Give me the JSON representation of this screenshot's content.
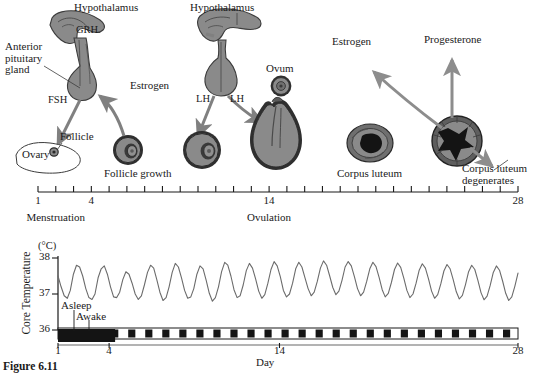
{
  "figure": {
    "caption": "Figure 6.11",
    "background": "#ffffff",
    "anatomy_fill": "#8a8a8a",
    "anatomy_stroke": "#3c3c3c",
    "arrow_color": "#808080",
    "dark_core": "#141414",
    "line_color": "#555555"
  },
  "top_panel": {
    "labels": {
      "hypothalamus_left": "Hypothalamus",
      "hypothalamus_right": "Hypothalamus",
      "grh": "GRH",
      "anterior_pituitary": "Anterior\npituitary\ngland",
      "fsh": "FSH",
      "follicle": "Follicle",
      "ovary": "Ovary",
      "estrogen_left": "Estrogen",
      "follicle_growth": "Follicle growth",
      "lh_left": "LH",
      "lh_right": "LH",
      "ovum": "Ovum",
      "estrogen_right": "Estrogen",
      "progesterone": "Progesterone",
      "corpus_luteum": "Corpus luteum",
      "corpus_luteum_degenerates": "Corpus luteum\ndegenerates"
    },
    "timeline": {
      "tick_count": 28,
      "day_start": 1,
      "day_end": 28,
      "tick_labels": [
        "1",
        "4",
        "14",
        "28"
      ],
      "tick_label_days": [
        1,
        4,
        14,
        28
      ],
      "phase_labels": [
        "Menstruation",
        "Ovulation"
      ],
      "phase_days": [
        2,
        14
      ]
    }
  },
  "chart_data": {
    "type": "line",
    "title": "",
    "ylabel": "Core Temperature",
    "yunit": "(°C)",
    "xlabel": "Day",
    "ylim": [
      36,
      38
    ],
    "yticks": [
      36,
      37,
      38
    ],
    "ytick_labels": [
      "36",
      "37",
      "38"
    ],
    "xlim": [
      1,
      28
    ],
    "xticks": [
      1,
      4,
      14,
      28
    ],
    "xtick_labels": [
      "1",
      "4",
      "14",
      "28"
    ],
    "grid": false,
    "legend": [
      "Asleep",
      "Awake"
    ],
    "series": [
      {
        "name": "Core temperature",
        "color": "#6b6b6b",
        "description": "Circadian oscillation, ~28 daily cycles, trough near 36.7 and peak near 37.9",
        "values": [
          37.5,
          37.2,
          36.95,
          36.88,
          37.1,
          37.55,
          37.8,
          37.75,
          37.5,
          37.15,
          36.9,
          36.85,
          37.0,
          37.45,
          37.7,
          37.78,
          37.55,
          37.2,
          36.92,
          36.9,
          37.05,
          37.4,
          37.62,
          37.55,
          37.3,
          37.0,
          36.85,
          36.95,
          37.25,
          37.6,
          37.8,
          37.72,
          37.4,
          37.05,
          36.82,
          36.9,
          37.2,
          37.6,
          37.85,
          37.75,
          37.45,
          37.1,
          36.88,
          36.92,
          37.15,
          37.55,
          37.78,
          37.7,
          37.38,
          37.02,
          36.8,
          36.9,
          37.2,
          37.62,
          37.88,
          37.8,
          37.5,
          37.12,
          36.9,
          36.95,
          37.25,
          37.65,
          37.85,
          37.72,
          37.42,
          37.08,
          36.88,
          36.98,
          37.3,
          37.68,
          37.9,
          37.78,
          37.48,
          37.1,
          36.92,
          37.0,
          37.3,
          37.7,
          37.88,
          37.75,
          37.45,
          37.15,
          36.95,
          37.05,
          37.35,
          37.72,
          37.92,
          37.8,
          37.5,
          37.18,
          36.98,
          37.08,
          37.38,
          37.75,
          37.9,
          37.78,
          37.48,
          37.15,
          36.95,
          37.05,
          37.35,
          37.7,
          37.88,
          37.76,
          37.46,
          37.12,
          36.92,
          37.02,
          37.32,
          37.68,
          37.86,
          37.74,
          37.44,
          37.1,
          36.9,
          37.0,
          37.3,
          37.66,
          37.84,
          37.72,
          37.42,
          37.08,
          36.88,
          36.98,
          37.28,
          37.64,
          37.82,
          37.7,
          37.4,
          37.06,
          36.86,
          36.96,
          37.26,
          37.62,
          37.8,
          37.68,
          37.38,
          37.04,
          36.84,
          36.94,
          37.24,
          37.6,
          37.78,
          37.66,
          37.36,
          37.02,
          36.82,
          36.92,
          37.22,
          37.58
        ]
      }
    ],
    "sleep_bar": {
      "description": "Alternating black (asleep) and white (awake) blocks across 28 days",
      "asleep_color": "#141414",
      "awake_color": "#ffffff",
      "menstruation_band_days": [
        1,
        4
      ],
      "menstruation_band_color": "#141414"
    }
  }
}
